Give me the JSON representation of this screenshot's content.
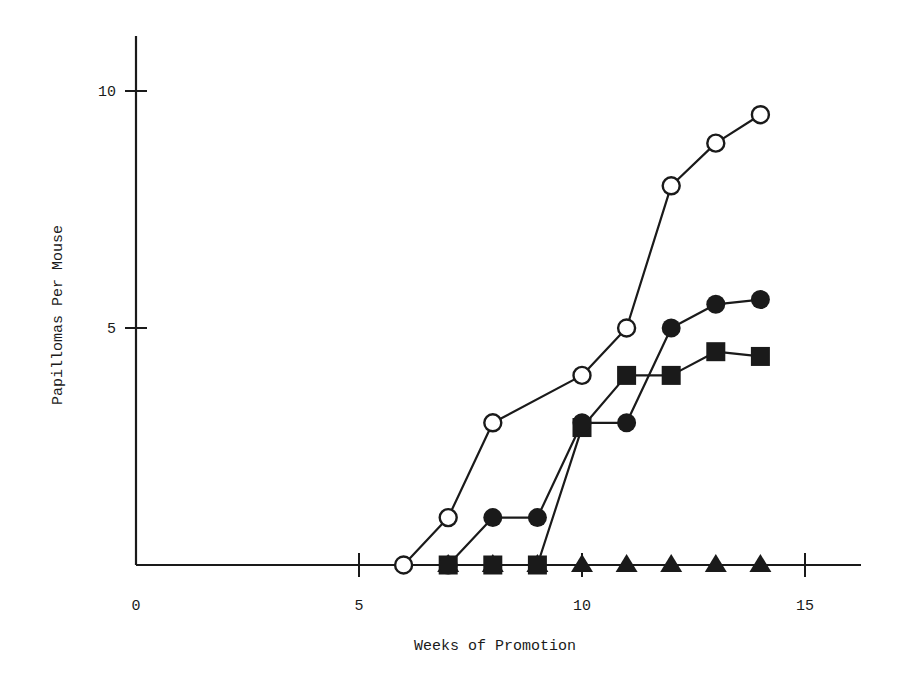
{
  "chart_data": {
    "type": "line",
    "title": "",
    "xlabel": "Weeks of Promotion",
    "ylabel": "Papillomas Per Mouse",
    "xlim": [
      0,
      16
    ],
    "ylim": [
      0,
      11
    ],
    "xticks": [
      0,
      5,
      10,
      15
    ],
    "yticks": [
      5,
      10
    ],
    "grid": false,
    "legend": null,
    "series": [
      {
        "name": "open-circle",
        "marker": "open-circle",
        "x": [
          6,
          7,
          8,
          10,
          11,
          12,
          13,
          14
        ],
        "values": [
          0,
          1.0,
          3.0,
          4.0,
          5.0,
          8.0,
          8.9,
          9.5
        ]
      },
      {
        "name": "filled-circle",
        "marker": "filled-circle",
        "x": [
          7,
          8,
          9,
          10,
          11,
          12,
          13,
          14
        ],
        "values": [
          0,
          1.0,
          1.0,
          3.0,
          3.0,
          5.0,
          5.5,
          5.6
        ]
      },
      {
        "name": "filled-square",
        "marker": "filled-square",
        "x": [
          7,
          8,
          9,
          10,
          11,
          12,
          13,
          14
        ],
        "values": [
          0,
          0,
          0,
          2.9,
          4.0,
          4.0,
          4.5,
          4.4
        ]
      },
      {
        "name": "filled-triangle",
        "marker": "filled-triangle",
        "x": [
          7,
          8,
          9,
          10,
          11,
          12,
          13,
          14
        ],
        "values": [
          0,
          0,
          0,
          0,
          0,
          0,
          0,
          0
        ]
      }
    ]
  },
  "axes": {
    "x_tick_labels": [
      "0",
      "5",
      "10",
      "15"
    ],
    "y_tick_labels": [
      "5",
      "10"
    ],
    "x_label": "Weeks of Promotion",
    "y_label": "Papillomas Per Mouse"
  }
}
